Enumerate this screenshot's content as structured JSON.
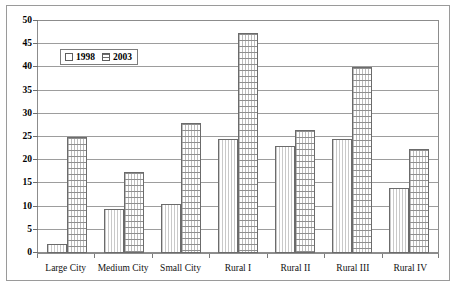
{
  "chart_data": {
    "type": "bar",
    "title": "",
    "xlabel": "",
    "ylabel": "",
    "ylim": [
      0,
      50
    ],
    "yticks": [
      0,
      5,
      10,
      15,
      20,
      25,
      30,
      35,
      40,
      45,
      50
    ],
    "grid": true,
    "legend_position": "upper-left-inside",
    "categories": [
      "Large City",
      "Medium City",
      "Small City",
      "Rural I",
      "Rural II",
      "Rural III",
      "Rural IV"
    ],
    "series": [
      {
        "name": "1998",
        "values": [
          2,
          9.5,
          10.5,
          24.5,
          23,
          24.5,
          14
        ]
      },
      {
        "name": "2003",
        "values": [
          25,
          17.5,
          28,
          47.5,
          26.5,
          40,
          22.5
        ]
      }
    ]
  },
  "legend": {
    "items": [
      {
        "label": "1998",
        "swatch": "square-vertical-hatch-swatch"
      },
      {
        "label": "2003",
        "swatch": "square-horizontal-hatch-swatch"
      }
    ]
  }
}
